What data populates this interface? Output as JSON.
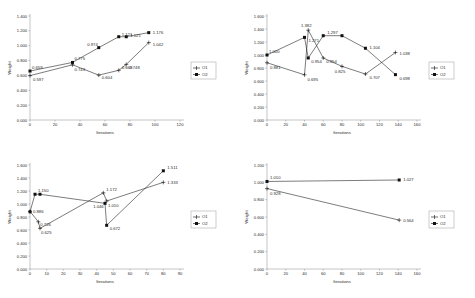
{
  "figure": {
    "axis_label_x": "Iterations",
    "axis_label_y": "Weight",
    "legend": {
      "series1": "O1",
      "series2": "O2"
    }
  },
  "chart_data": [
    {
      "id": "chart-top-left",
      "type": "line",
      "title": "",
      "xlabel": "Iterations",
      "ylabel": "Weight",
      "xlim": [
        0,
        120
      ],
      "ylim": [
        0.0,
        1.4
      ],
      "xticks": [
        0,
        20,
        40,
        60,
        80,
        100,
        120
      ],
      "yticks": [
        "0.000",
        "0.200",
        "0.400",
        "0.600",
        "0.800",
        "1.000",
        "1.200",
        "1.400"
      ],
      "grid": false,
      "legend_position": "right",
      "series": [
        {
          "name": "O1",
          "marker": "plus",
          "x": [
            0,
            34,
            55,
            71,
            77,
            95
          ],
          "y": [
            0.597,
            0.743,
            0.604,
            0.669,
            0.748,
            1.042
          ],
          "labels": [
            "0.597",
            "0.743",
            "0.604",
            "0.669",
            "0.748",
            "1.042"
          ]
        },
        {
          "name": "O2",
          "marker": "square",
          "x": [
            0,
            34,
            55,
            71,
            77,
            95
          ],
          "y": [
            0.659,
            0.775,
            0.974,
            1.121,
            1.121,
            1.176
          ],
          "labels": [
            "0.659",
            "0.775",
            "0.974",
            "1.121",
            "1.121",
            "1.176"
          ]
        }
      ]
    },
    {
      "id": "chart-top-right",
      "type": "line",
      "title": "",
      "xlabel": "Iterations",
      "ylabel": "Weight",
      "xlim": [
        0,
        160
      ],
      "ylim": [
        0.0,
        1.6
      ],
      "xticks": [
        0,
        20,
        40,
        60,
        80,
        100,
        120,
        140,
        160
      ],
      "yticks": [
        "0.000",
        "0.200",
        "0.400",
        "0.600",
        "0.800",
        "1.000",
        "1.200",
        "1.400",
        "1.600"
      ],
      "grid": false,
      "legend_position": "right",
      "series": [
        {
          "name": "O1",
          "marker": "plus",
          "x": [
            0,
            40,
            44,
            60,
            80,
            105,
            137
          ],
          "y": [
            0.881,
            0.695,
            1.382,
            0.954,
            0.825,
            0.707,
            1.038
          ],
          "labels": [
            "0.881",
            "0.695",
            "1.382",
            "0.954",
            "0.825",
            "0.707",
            "1.038"
          ]
        },
        {
          "name": "O2",
          "marker": "square",
          "x": [
            0,
            40,
            44,
            60,
            80,
            105,
            137
          ],
          "y": [
            1.0,
            1.271,
            0.954,
            1.297,
            1.297,
            1.104,
            0.698
          ],
          "labels": [
            "1.000",
            "1.271",
            "0.954",
            "1.297",
            "1.104",
            "0.698"
          ]
        }
      ]
    },
    {
      "id": "chart-bottom-left",
      "type": "line",
      "title": "",
      "xlabel": "Iterations",
      "ylabel": "Weight",
      "xlim": [
        0,
        90
      ],
      "ylim": [
        0.0,
        1.6
      ],
      "xticks": [
        0,
        10,
        20,
        30,
        40,
        50,
        60,
        70,
        80,
        90
      ],
      "yticks": [
        "0.000",
        "0.200",
        "0.400",
        "0.600",
        "0.800",
        "1.000",
        "1.200",
        "1.400",
        "1.600"
      ],
      "grid": false,
      "legend_position": "right",
      "series": [
        {
          "name": "O1",
          "marker": "plus",
          "x": [
            0,
            5,
            6,
            44,
            46,
            80
          ],
          "y": [
            0.886,
            0.726,
            0.625,
            1.172,
            1.046,
            1.333
          ],
          "labels": [
            "0.886",
            "0.726",
            "0.625",
            "1.172",
            "1.046",
            "1.333"
          ]
        },
        {
          "name": "O2",
          "marker": "square",
          "x": [
            0,
            3,
            6,
            45,
            46,
            80
          ],
          "y": [
            0.88,
            1.15,
            1.15,
            1.01,
            0.672,
            1.511
          ],
          "labels": [
            "1.150",
            "1.010",
            "0.672",
            "1.511"
          ]
        }
      ]
    },
    {
      "id": "chart-bottom-right",
      "type": "line",
      "title": "",
      "xlabel": "Iterations",
      "ylabel": "Weight",
      "xlim": [
        0,
        160
      ],
      "ylim": [
        0.0,
        1.2
      ],
      "xticks": [
        0,
        20,
        40,
        60,
        80,
        100,
        120,
        140,
        160
      ],
      "yticks": [
        "0.000",
        "0.200",
        "0.400",
        "0.600",
        "0.800",
        "1.000",
        "1.200"
      ],
      "grid": false,
      "legend_position": "right",
      "series": [
        {
          "name": "O1",
          "marker": "plus",
          "x": [
            0,
            141
          ],
          "y": [
            0.928,
            0.564
          ],
          "labels": [
            "0.928",
            "0.564"
          ]
        },
        {
          "name": "O2",
          "marker": "square",
          "x": [
            0,
            141
          ],
          "y": [
            1.01,
            1.027
          ],
          "labels": [
            "1.010",
            "1.027"
          ]
        }
      ]
    }
  ]
}
